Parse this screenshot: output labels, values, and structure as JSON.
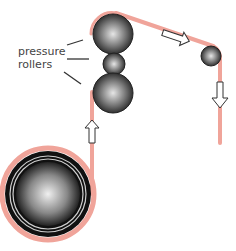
{
  "diagram": {
    "labels": {
      "pressure": "pressure",
      "rollers": "rollers"
    },
    "colors": {
      "strip": "#f0a49a",
      "roller_dark": "#1a1a1a",
      "roller_light": "#d8d8d8",
      "leader_line": "#333333",
      "arrow_fill": "#ffffff",
      "arrow_stroke": "#333333"
    },
    "components": [
      {
        "name": "coil",
        "type": "spool"
      },
      {
        "name": "pressure-roller-top",
        "type": "roller"
      },
      {
        "name": "pressure-roller-middle",
        "type": "roller"
      },
      {
        "name": "pressure-roller-bottom",
        "type": "roller"
      },
      {
        "name": "guide-roller",
        "type": "roller"
      }
    ],
    "arrows": [
      {
        "name": "arrow-up",
        "direction": "up"
      },
      {
        "name": "arrow-right-down",
        "direction": "right-down"
      },
      {
        "name": "arrow-down",
        "direction": "down"
      }
    ]
  }
}
